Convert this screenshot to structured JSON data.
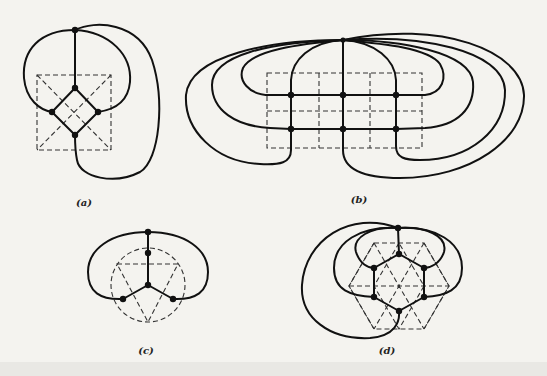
{
  "figure": {
    "panels": [
      {
        "id": "a",
        "caption": "(a)",
        "description": "Graph drawn over dashed square with diagonals; diamond of 4 vertices plus top vertex"
      },
      {
        "id": "b",
        "caption": "(b)",
        "description": "Graph drawn over dashed 3x2 grid; 6 grid vertices plus one apex vertex with looping edges"
      },
      {
        "id": "c",
        "caption": "(c)",
        "description": "Graph drawn over dashed circle with inscribed triangle; center vertex with three spokes"
      },
      {
        "id": "d",
        "caption": "(d)",
        "description": "Graph drawn over dashed hexagram; hexagon of 6 vertices plus apex vertex"
      }
    ]
  },
  "colors": {
    "background": "#f4f3ef",
    "stroke": "#111111",
    "dashed": "#333333"
  }
}
